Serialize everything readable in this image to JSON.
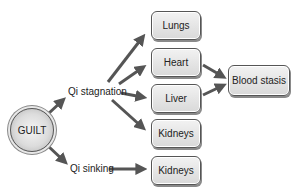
{
  "diagram": {
    "root": {
      "label": "GUILT"
    },
    "branches": [
      {
        "label": "Qi stagnation",
        "targets": [
          "Lungs",
          "Heart",
          "Liver",
          "Kidneys"
        ]
      },
      {
        "label": "Qi sinking",
        "targets": [
          "Kidneys"
        ]
      }
    ],
    "boxes": {
      "lungs": "Lungs",
      "heart": "Heart",
      "liver": "Liver",
      "kidneys_1": "Kidneys",
      "kidneys_2": "Kidneys",
      "blood_stasis": "Blood stasis"
    },
    "convergence": {
      "sources": [
        "Heart",
        "Liver"
      ],
      "target": "Blood stasis"
    },
    "colors": {
      "arrow": "#555555",
      "box_fill": "#e4e4e4",
      "border": "#555555"
    }
  }
}
